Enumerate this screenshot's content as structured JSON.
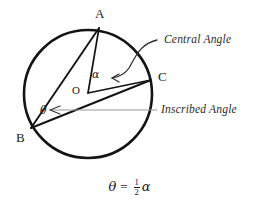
{
  "figure": {
    "background_color": "#ffffff",
    "stroke_color": "#1a1a1a",
    "annotation_color": "#2b2b2b",
    "points": {
      "A": {
        "label": "A",
        "x": 99,
        "y": 27,
        "label_x": 95,
        "label_y": 7
      },
      "B": {
        "label": "B",
        "x": 30,
        "y": 128,
        "label_x": 16,
        "label_y": 131
      },
      "C": {
        "label": "C",
        "x": 152,
        "y": 80,
        "label_x": 158,
        "label_y": 70
      },
      "O": {
        "label": "O",
        "x": 88,
        "y": 93,
        "label_x": 72,
        "label_y": 84
      }
    },
    "circle": {
      "cx": 88,
      "cy": 94,
      "r": 64
    },
    "angles": {
      "central": {
        "symbol": "α",
        "label_x": 92,
        "label_y": 74,
        "vertex": "O"
      },
      "inscribed": {
        "symbol": "θ",
        "label_x": 40,
        "label_y": 110,
        "vertex": "B"
      }
    },
    "callouts": {
      "central": {
        "text": "Central Angle",
        "x": 164,
        "y": 33
      },
      "inscribed": {
        "text": "Inscribed Angle",
        "x": 162,
        "y": 104
      }
    },
    "formula": {
      "theta": "θ",
      "equals": "=",
      "numerator": "1",
      "denominator": "2",
      "alpha": "α"
    }
  }
}
